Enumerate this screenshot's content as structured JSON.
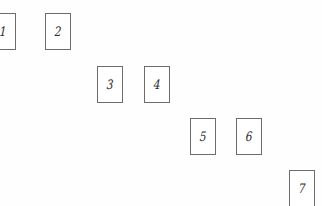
{
  "diagram": {
    "background_color": "#fefefe",
    "box_fill_color": "#ffffff",
    "box_border_color": "#6b6b6b",
    "label_color": "#2b2b2b",
    "canvas": {
      "width": 322,
      "height": 206
    },
    "boxes": [
      {
        "label": "1",
        "name": "box-1",
        "x": -10,
        "y": 13,
        "width": 26,
        "height": 37,
        "clipped": "left"
      },
      {
        "label": "2",
        "name": "box-2",
        "x": 45,
        "y": 13,
        "width": 26,
        "height": 37,
        "clipped": "none"
      },
      {
        "label": "3",
        "name": "box-3",
        "x": 97,
        "y": 66,
        "width": 26,
        "height": 37,
        "clipped": "none"
      },
      {
        "label": "4",
        "name": "box-4",
        "x": 144,
        "y": 66,
        "width": 26,
        "height": 37,
        "clipped": "none"
      },
      {
        "label": "5",
        "name": "box-5",
        "x": 190,
        "y": 118,
        "width": 26,
        "height": 37,
        "clipped": "none"
      },
      {
        "label": "6",
        "name": "box-6",
        "x": 236,
        "y": 118,
        "width": 26,
        "height": 37,
        "clipped": "none"
      },
      {
        "label": "7",
        "name": "box-7",
        "x": 289,
        "y": 170,
        "width": 26,
        "height": 37,
        "clipped": "bottom"
      }
    ]
  }
}
